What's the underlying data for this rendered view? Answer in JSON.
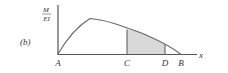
{
  "figure": {
    "part_label": "(b)",
    "y_axis_label_num": "M",
    "y_axis_label_den": "EI",
    "x_axis_label": "x",
    "points": [
      "A",
      "C",
      "D",
      "B"
    ],
    "shaded_region": "C to D",
    "colors": {
      "line": "#555555",
      "shade": "#d9d9d9"
    }
  }
}
